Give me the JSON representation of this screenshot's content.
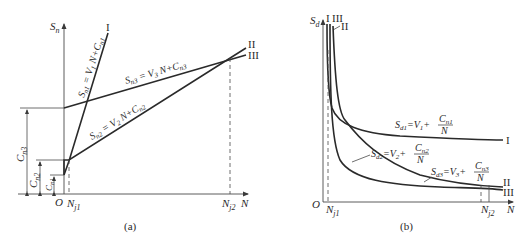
{
  "figure_a": {
    "caption": "(a)",
    "y_axis_label": "S",
    "y_axis_sub": "n",
    "x_axis_label": "N",
    "origin_label": "O",
    "x_ticks": [
      {
        "main": "N",
        "sub": "j1"
      },
      {
        "main": "N",
        "sub": "j2"
      }
    ],
    "line_labels": {
      "I": "I",
      "II": "II",
      "III": "III"
    },
    "equations": {
      "eq1": "S",
      "eq1_sub": "n1",
      "eq1_rest": " = V",
      "eq1_vsub": "1",
      "eq1_tail": " N+C",
      "eq1_csub": "n1",
      "eq2": "S",
      "eq2_sub": "n2",
      "eq2_rest": " = V",
      "eq2_vsub": "2",
      "eq2_tail": " N+C",
      "eq2_csub": "n2",
      "eq3": "S",
      "eq3_sub": "n3",
      "eq3_rest": " = V",
      "eq3_vsub": "3",
      "eq3_tail": " N+C",
      "eq3_csub": "n3"
    },
    "intercepts": [
      {
        "main": "C",
        "sub": "n1"
      },
      {
        "main": "C",
        "sub": "n2"
      },
      {
        "main": "C",
        "sub": "n3"
      }
    ]
  },
  "figure_b": {
    "caption": "(b)",
    "y_axis_label": "S",
    "y_axis_sub": "d",
    "x_axis_label": "N",
    "origin_label": "O",
    "x_ticks": [
      {
        "main": "N",
        "sub": "j1"
      },
      {
        "main": "N",
        "sub": "j2"
      }
    ],
    "curve_labels_top": {
      "I": "I",
      "III": "III",
      "II": "II"
    },
    "curve_labels_right": {
      "I": "I",
      "II": "II",
      "III": "III"
    },
    "equations": [
      {
        "lhs": "S",
        "lhs_sub": "d1",
        "mid": "=V",
        "v_sub": "1",
        "plus": "+",
        "num": "C",
        "num_sub": "n1",
        "den": "N"
      },
      {
        "lhs": "S",
        "lhs_sub": "d2",
        "mid": "=V",
        "v_sub": "2",
        "plus": "+",
        "num": "C",
        "num_sub": "n2",
        "den": "N"
      },
      {
        "lhs": "S",
        "lhs_sub": "d3",
        "mid": "=V",
        "v_sub": "3",
        "plus": "+",
        "num": "C",
        "num_sub": "n3",
        "den": "N"
      }
    ]
  }
}
